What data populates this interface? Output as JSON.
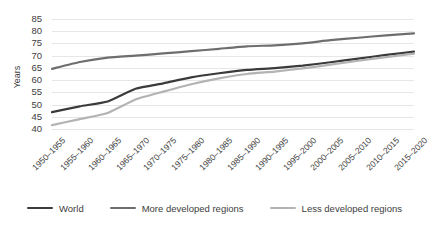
{
  "chart_data": {
    "type": "line",
    "title": "",
    "xlabel": "",
    "ylabel": "Years",
    "ylim": [
      38,
      87
    ],
    "yticks": [
      40,
      45,
      50,
      55,
      60,
      65,
      70,
      75,
      80,
      85
    ],
    "grid": true,
    "legend_position": "bottom",
    "categories": [
      "1950–1955",
      "1955–1960",
      "1960–1965",
      "1965–1970",
      "1970–1975",
      "1975–1980",
      "1980–1985",
      "1985–1990",
      "1990–1995",
      "1995–2000",
      "2000–2005",
      "2005–2010",
      "2010–2015",
      "2015–2020"
    ],
    "series": [
      {
        "name": "World",
        "color": "#3b3b3b",
        "values": [
          46.9,
          49.3,
          51.3,
          56.5,
          58.7,
          61.1,
          62.8,
          64.2,
          64.9,
          65.9,
          67.3,
          68.8,
          70.3,
          71.6
        ]
      },
      {
        "name": "More developed regions",
        "color": "#6e6e6e",
        "values": [
          64.6,
          67.4,
          69.2,
          70.0,
          70.9,
          71.8,
          72.8,
          73.8,
          74.2,
          75.0,
          76.3,
          77.3,
          78.3,
          79.1
        ]
      },
      {
        "name": "Less developed regions",
        "color": "#b3b3b3",
        "values": [
          41.6,
          44.1,
          46.6,
          52.1,
          55.3,
          58.3,
          60.7,
          62.5,
          63.5,
          64.8,
          66.3,
          67.9,
          69.4,
          70.8
        ]
      }
    ]
  },
  "legend": {
    "items": [
      {
        "label": "World",
        "color": "#3b3b3b"
      },
      {
        "label": "More developed regions",
        "color": "#6e6e6e"
      },
      {
        "label": "Less developed regions",
        "color": "#b3b3b3"
      }
    ]
  },
  "axis": {
    "y_title": "Years"
  }
}
